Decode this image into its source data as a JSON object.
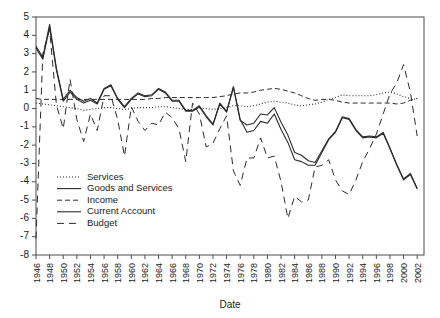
{
  "chart_data": {
    "type": "line",
    "title": "",
    "xlabel": "Date",
    "ylabel": "",
    "grid": false,
    "legend_position": "inside-lower-left",
    "xlim": [
      1946,
      2003
    ],
    "ylim": [
      -8,
      5
    ],
    "ytick_labels": [
      "5",
      "4",
      "3",
      "2",
      "1",
      "0",
      "-1",
      "-2",
      "-3",
      "-4",
      "-5",
      "-6",
      "-7",
      "-8"
    ],
    "yticks": [
      5,
      4,
      3,
      2,
      1,
      0,
      -1,
      -2,
      -3,
      -4,
      -5,
      -6,
      -7,
      -8
    ],
    "xtick_labels": [
      "1946",
      "1948",
      "1950",
      "1952",
      "1954",
      "1956",
      "1958",
      "1960",
      "1962",
      "1964",
      "1966",
      "1968",
      "1970",
      "1972",
      "1974",
      "1976",
      "1978",
      "1980",
      "1982",
      "1984",
      "1986",
      "1988",
      "1990",
      "1992",
      "1994",
      "1996",
      "1998",
      "2000",
      "2002"
    ],
    "xticks": [
      1946,
      1948,
      1950,
      1952,
      1954,
      1956,
      1958,
      1960,
      1962,
      1964,
      1966,
      1968,
      1970,
      1972,
      1974,
      1976,
      1978,
      1980,
      1982,
      1984,
      1986,
      1988,
      1990,
      1992,
      1994,
      1996,
      1998,
      2000,
      2002
    ],
    "x": [
      1946,
      1947,
      1948,
      1949,
      1950,
      1951,
      1952,
      1953,
      1954,
      1955,
      1956,
      1957,
      1958,
      1959,
      1960,
      1961,
      1962,
      1963,
      1964,
      1965,
      1966,
      1967,
      1968,
      1969,
      1970,
      1971,
      1972,
      1973,
      1974,
      1975,
      1976,
      1977,
      1978,
      1979,
      1980,
      1981,
      1982,
      1983,
      1984,
      1985,
      1986,
      1987,
      1988,
      1989,
      1990,
      1991,
      1992,
      1993,
      1994,
      1995,
      1996,
      1997,
      1998,
      1999,
      2000,
      2001,
      2002
    ],
    "series": [
      {
        "name": "Services",
        "style": "dotted",
        "values": [
          0.3,
          0.25,
          0.2,
          0.15,
          0.1,
          0.05,
          0.0,
          -0.1,
          -0.05,
          0.0,
          0.05,
          0.05,
          0.0,
          -0.05,
          0.0,
          0.05,
          0.05,
          0.05,
          0.1,
          0.1,
          0.05,
          0.0,
          -0.05,
          -0.05,
          0.0,
          0.0,
          -0.05,
          0.0,
          0.05,
          0.15,
          0.15,
          0.1,
          0.15,
          0.25,
          0.35,
          0.4,
          0.35,
          0.3,
          0.2,
          0.15,
          0.2,
          0.25,
          0.35,
          0.5,
          0.6,
          0.75,
          0.7,
          0.7,
          0.7,
          0.7,
          0.75,
          0.85,
          0.9,
          0.8,
          0.65,
          0.55,
          0.5
        ]
      },
      {
        "name": "Goods and Services",
        "style": "solid",
        "values": [
          3.4,
          2.8,
          4.6,
          2.2,
          0.5,
          1.0,
          0.6,
          0.4,
          0.55,
          0.3,
          1.1,
          1.3,
          0.55,
          0.1,
          0.55,
          0.85,
          0.7,
          0.75,
          1.1,
          0.9,
          0.45,
          0.45,
          -0.1,
          -0.1,
          0.15,
          -0.4,
          -0.85,
          0.3,
          -0.15,
          1.2,
          -0.6,
          -1.3,
          -1.2,
          -0.7,
          -0.8,
          -0.3,
          -1.15,
          -1.85,
          -2.8,
          -2.9,
          -3.1,
          -3.1,
          -2.4,
          -1.7,
          -1.3,
          -0.5,
          -0.6,
          -1.2,
          -1.6,
          -1.55,
          -1.6,
          -1.35,
          -2.2,
          -3.1,
          -3.9,
          -3.6,
          -4.4
        ]
      },
      {
        "name": "Income",
        "style": "dashed",
        "values": [
          0.55,
          0.5,
          0.5,
          0.5,
          0.5,
          0.5,
          0.5,
          0.5,
          0.5,
          0.5,
          0.5,
          0.5,
          0.5,
          0.5,
          0.5,
          0.5,
          0.5,
          0.55,
          0.55,
          0.6,
          0.6,
          0.6,
          0.6,
          0.6,
          0.6,
          0.6,
          0.6,
          0.65,
          0.7,
          0.8,
          0.85,
          0.85,
          0.9,
          1.0,
          1.05,
          1.1,
          1.05,
          0.95,
          0.85,
          0.7,
          0.55,
          0.45,
          0.5,
          0.5,
          0.45,
          0.35,
          0.3,
          0.3,
          0.3,
          0.3,
          0.3,
          0.3,
          0.3,
          0.25,
          0.3,
          0.45,
          0.55
        ]
      },
      {
        "name": "Current Account",
        "style": "solid",
        "values": [
          3.3,
          2.7,
          4.45,
          2.1,
          0.4,
          0.9,
          0.5,
          0.3,
          0.45,
          0.25,
          1.05,
          1.25,
          0.5,
          0.05,
          0.5,
          0.8,
          0.65,
          0.7,
          1.05,
          0.85,
          0.4,
          0.4,
          -0.15,
          -0.15,
          0.1,
          -0.45,
          -0.9,
          0.25,
          -0.2,
          1.15,
          -0.65,
          -0.9,
          -0.8,
          -0.3,
          -0.35,
          0.05,
          -0.75,
          -1.45,
          -2.4,
          -2.55,
          -2.85,
          -2.95,
          -2.3,
          -1.65,
          -1.25,
          -0.45,
          -0.55,
          -1.15,
          -1.55,
          -1.5,
          -1.55,
          -1.3,
          -2.15,
          -3.05,
          -3.85,
          -3.55,
          -4.35
        ]
      },
      {
        "name": "Budget",
        "style": "longdash",
        "values": [
          -7.1,
          3.0,
          4.3,
          0.2,
          -1.1,
          1.6,
          -0.6,
          -1.8,
          -0.3,
          -1.2,
          0.7,
          0.7,
          -0.6,
          -2.6,
          0.1,
          -0.7,
          -1.2,
          -0.8,
          -0.9,
          -0.2,
          -0.5,
          -1.1,
          -2.9,
          0.3,
          -0.3,
          -2.1,
          -1.9,
          -1.1,
          -0.4,
          -3.4,
          -4.2,
          -2.7,
          -2.7,
          -1.6,
          -2.7,
          -2.6,
          -4.0,
          -6.0,
          -4.8,
          -5.1,
          -5.0,
          -3.2,
          -3.1,
          -2.8,
          -3.9,
          -4.5,
          -4.7,
          -3.9,
          -2.9,
          -2.2,
          -1.4,
          -0.3,
          0.8,
          1.4,
          2.4,
          0.9,
          -1.5
        ]
      }
    ]
  },
  "legend": {
    "items": [
      {
        "label": "Services",
        "style": "dotted"
      },
      {
        "label": "Goods and Services",
        "style": "solid"
      },
      {
        "label": "Income",
        "style": "dashed"
      },
      {
        "label": "Current Account",
        "style": "solid"
      },
      {
        "label": "Budget",
        "style": "longdash"
      }
    ]
  },
  "colors": {
    "line": "#2b2b2b",
    "axis": "#4d4d4d",
    "text": "#1a1a1a",
    "background": "#ffffff"
  }
}
